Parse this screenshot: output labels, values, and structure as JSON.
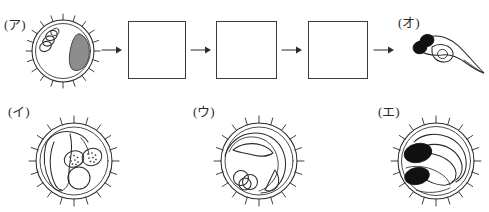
{
  "worksheet": {
    "title": "Fish egg development sequence diagram",
    "topic": "Stages of fish (medaka) egg development",
    "background_color": "#ffffff",
    "ink_color": "#2b2b2b"
  },
  "sequence": {
    "description": "Left-to-right development sequence with three blank answer boxes",
    "start_label": "(ア)",
    "end_label": "(オ)",
    "arrows": [
      {
        "name": "arrow-1",
        "glyph": "→"
      },
      {
        "name": "arrow-2",
        "glyph": "→"
      },
      {
        "name": "arrow-3",
        "glyph": "→"
      },
      {
        "name": "arrow-4",
        "glyph": "→"
      }
    ],
    "answer_boxes": [
      {
        "name": "answer-box-1",
        "value": ""
      },
      {
        "name": "answer-box-2",
        "value": ""
      },
      {
        "name": "answer-box-3",
        "value": ""
      }
    ]
  },
  "figures": [
    {
      "id": "a",
      "label": "(ア)",
      "stage": "fertilized egg with oil globules and shaded blastodisc",
      "shape": "circle with radial filaments",
      "features": [
        "oil-globule-cluster",
        "shaded-blastodisc",
        "double-membrane",
        "radial-filaments"
      ]
    },
    {
      "id": "i",
      "label": "(イ)",
      "stage": "embryo with developing eye vesicles and oil globule",
      "shape": "circle with radial filaments",
      "features": [
        "two-stippled-eye-vesicles",
        "large-oil-globule",
        "curved-embryo-body",
        "radial-filaments"
      ]
    },
    {
      "id": "u",
      "label": "(ウ)",
      "stage": "early embryonic shield stage",
      "shape": "circle with radial filaments",
      "features": [
        "embryonic-band",
        "oil-globule-cluster",
        "radial-filaments"
      ]
    },
    {
      "id": "e",
      "label": "(エ)",
      "stage": "late embryo with pigmented eyes",
      "shape": "circle with radial filaments",
      "features": [
        "two-black-eyes",
        "coiled-body",
        "radial-filaments"
      ]
    },
    {
      "id": "o",
      "label": "(オ)",
      "stage": "hatched larva with yolk sac and tail",
      "shape": "free-swimming larva",
      "features": [
        "two-black-eyes",
        "yolk-sac",
        "tapering-tail"
      ]
    }
  ]
}
